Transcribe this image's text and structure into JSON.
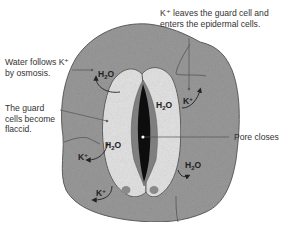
{
  "colors": {
    "epidermis": "#9a9a9a",
    "epidermis_outline": "#555555",
    "guard_cell": "#e4e4e4",
    "pore_rim": "#7f7f7f",
    "pore": "#0d0d0d",
    "nucleus": "#8a8a8a",
    "text": "#333333",
    "leader_line": "#555555",
    "arrow": "#222222"
  },
  "callouts": {
    "k_leaves": "K⁺ leaves the guard cell and\nenters the epidermal cells.",
    "water_follows": "Water follows K⁺\nby osmosis.",
    "guard_flaccid": "The guard\ncells become\nflaccid.",
    "pore_closes": "Pore closes"
  },
  "inline_labels": [
    {
      "id": "h2o-epidermis-left-top",
      "base": "H",
      "sub": "2",
      "tail": "O"
    },
    {
      "id": "h2o-guard-right-top",
      "base": "H",
      "sub": "2",
      "tail": "O"
    },
    {
      "id": "k-epidermis-right-top",
      "base": "K",
      "sup": "+"
    },
    {
      "id": "h2o-guard-left-mid",
      "base": "H",
      "sub": "2",
      "tail": "O"
    },
    {
      "id": "k-epidermis-left-mid",
      "base": "K",
      "sup": "+"
    },
    {
      "id": "h2o-epidermis-right-bottom",
      "base": "H",
      "sub": "2",
      "tail": "O"
    },
    {
      "id": "k-epidermis-left-bottom",
      "base": "K",
      "sup": "+"
    }
  ]
}
